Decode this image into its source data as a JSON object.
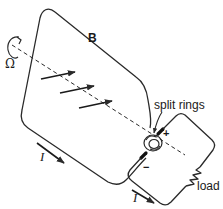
{
  "diagram": {
    "type": "ac-generator-split-ring-commutator",
    "labels": {
      "magnetic_field": "B",
      "angular_velocity": "Ω",
      "current_loop": "I",
      "current_load": "I",
      "split_rings": "split rings",
      "load": "load",
      "positive_terminal": "+",
      "negative_terminal": "−"
    },
    "colors": {
      "line": "#2a2a2a",
      "background": "#ffffff"
    }
  }
}
